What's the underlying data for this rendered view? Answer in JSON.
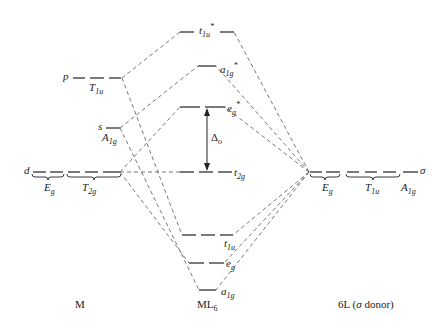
{
  "diagram": {
    "type": "molecular orbital energy-level diagram",
    "columns": {
      "metal": "M",
      "complex": "ML",
      "complex_sub": "6",
      "ligand": "6L (",
      "ligand_sigma": "σ",
      "ligand_tail": " donor)"
    },
    "metal_orbitals": {
      "p": {
        "letter": "p",
        "sym": "T",
        "sub": "1u"
      },
      "s": {
        "letter": "s",
        "sym": "A",
        "sub": "1g"
      },
      "d": {
        "letter": "d",
        "sym1": "E",
        "sub1": "g",
        "sym2": "T",
        "sub2": "2g"
      }
    },
    "mo_levels": {
      "t1u_star": {
        "main": "t",
        "sub": "1u",
        "sup": "*"
      },
      "a1g_star": {
        "main": "a",
        "sub": "1g",
        "sup": "*"
      },
      "eg_star": {
        "main": "e",
        "sub": "g",
        "sup": "*"
      },
      "t2g": {
        "main": "t",
        "sub": "2g"
      },
      "t1u": {
        "main": "t",
        "sub": "1u"
      },
      "eg": {
        "main": "e",
        "sub": "g"
      },
      "a1g": {
        "main": "a",
        "sub": "1g"
      }
    },
    "splitting_label": {
      "main": "Δ",
      "sub": "o"
    },
    "ligand_orbitals": {
      "sym1": "E",
      "sub1": "g",
      "sym2": "T",
      "sub2": "1u",
      "sym3": "A",
      "sub3": "1g",
      "sigma": "σ"
    }
  }
}
